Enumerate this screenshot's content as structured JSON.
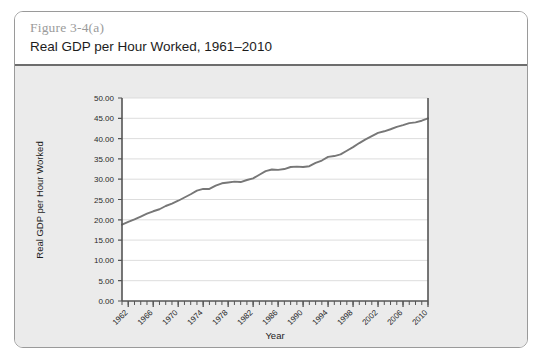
{
  "figure": {
    "number": "Figure 3-4(a)",
    "title": "Real GDP per Hour Worked, 1961–2010"
  },
  "colors": {
    "card_border": "#9a9a9a",
    "panel_background": "#ebebeb",
    "plot_background": "#ffffff",
    "gridline": "#d9d9d9",
    "axis": "#555555",
    "series_line": "#777777",
    "figure_number_text": "#9b9b9b",
    "title_text": "#1c1c1c",
    "divider": "#6d6d6d"
  },
  "chart_data": {
    "type": "line",
    "title": "Real GDP per Hour Worked, 1961–2010",
    "xlabel": "Year",
    "ylabel": "Real GDP per Hour Worked",
    "xlim": [
      1961,
      2010
    ],
    "ylim": [
      0.0,
      50.0
    ],
    "grid": true,
    "legend": "none",
    "y_ticks": [
      0.0,
      5.0,
      10.0,
      15.0,
      20.0,
      25.0,
      30.0,
      35.0,
      40.0,
      45.0,
      50.0
    ],
    "y_tick_labels": [
      "0.00",
      "5.00",
      "10.00",
      "15.00",
      "20.00",
      "25.00",
      "30.00",
      "35.00",
      "40.00",
      "45.00",
      "50.00"
    ],
    "x_ticks": [
      1962,
      1966,
      1970,
      1974,
      1978,
      1982,
      1986,
      1990,
      1994,
      1998,
      2002,
      2006,
      2010
    ],
    "x_tick_labels": [
      "1962",
      "1966",
      "1970",
      "1974",
      "1978",
      "1982",
      "1986",
      "1990",
      "1994",
      "1998",
      "2002",
      "2006",
      "2010"
    ],
    "x_minor_tick_interval": 1,
    "series": [
      {
        "name": "Real GDP per Hour Worked",
        "x": [
          1961,
          1962,
          1963,
          1964,
          1965,
          1966,
          1967,
          1968,
          1969,
          1970,
          1971,
          1972,
          1973,
          1974,
          1975,
          1976,
          1977,
          1978,
          1979,
          1980,
          1981,
          1982,
          1983,
          1984,
          1985,
          1986,
          1987,
          1988,
          1989,
          1990,
          1991,
          1992,
          1993,
          1994,
          1995,
          1996,
          1997,
          1998,
          1999,
          2000,
          2001,
          2002,
          2003,
          2004,
          2005,
          2006,
          2007,
          2008,
          2009,
          2010
        ],
        "values": [
          18.8,
          19.5,
          20.1,
          20.8,
          21.5,
          22.1,
          22.6,
          23.4,
          24.0,
          24.7,
          25.5,
          26.3,
          27.2,
          27.6,
          27.6,
          28.4,
          29.0,
          29.2,
          29.4,
          29.3,
          29.8,
          30.2,
          31.1,
          32.0,
          32.4,
          32.3,
          32.5,
          33.0,
          33.1,
          33.0,
          33.2,
          34.0,
          34.6,
          35.5,
          35.7,
          36.1,
          37.0,
          37.9,
          38.9,
          39.8,
          40.6,
          41.4,
          41.8,
          42.3,
          42.9,
          43.3,
          43.8,
          44.0,
          44.4,
          45.0
        ]
      }
    ]
  }
}
